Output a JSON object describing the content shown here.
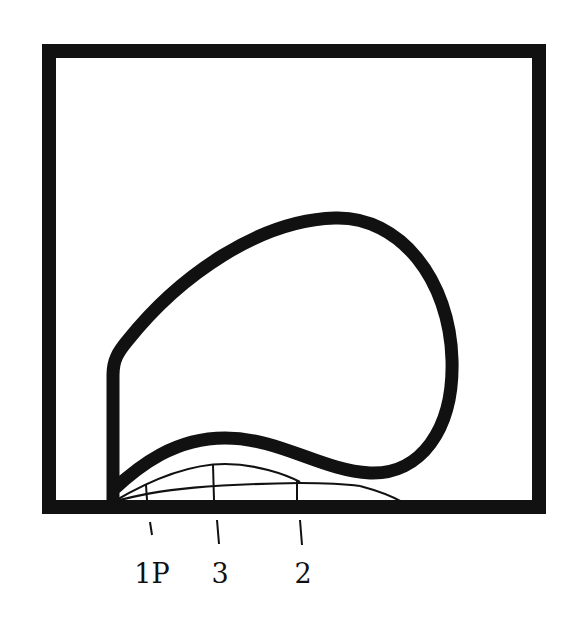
{
  "figure": {
    "colors": {
      "ink": "#111111",
      "background": "#ffffff"
    },
    "curves": [
      {
        "id": "1P",
        "label": "1P"
      },
      {
        "id": "3",
        "label": "3"
      },
      {
        "id": "2",
        "label": "2"
      }
    ],
    "labels": {
      "l1": "1P",
      "l2": "3",
      "l3": "2"
    }
  }
}
